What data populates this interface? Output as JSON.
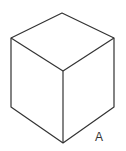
{
  "diagram": {
    "type": "isometric-cube",
    "stroke_color": "#333333",
    "vertices": {
      "top": [
        62,
        13
      ],
      "left_top": [
        11,
        38
      ],
      "right_top": [
        114,
        38
      ],
      "center": [
        63,
        71
      ],
      "left_bottom": [
        11,
        107
      ],
      "right_bottom": [
        114,
        107
      ],
      "bottom": [
        63,
        143
      ]
    },
    "labels": [
      {
        "text": "A",
        "x": 95,
        "y": 131
      }
    ]
  }
}
